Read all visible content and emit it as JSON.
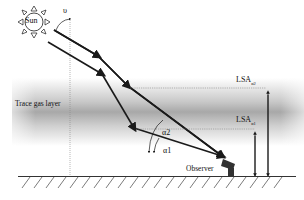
{
  "labels": {
    "sun": "Sun",
    "zenith_angle": "υ",
    "trace_gas_layer": "Trace gas layer",
    "alpha1": "α1",
    "alpha2": "α2",
    "observer": "Observer",
    "lsa1_main": "LSA",
    "lsa1_sub": "α1",
    "lsa2_main": "LSA",
    "lsa2_sub": "α2"
  },
  "colors": {
    "ink": "#1a1a1a",
    "layer_dark": "#9a9a9a",
    "layer_light": "#ffffff",
    "ground": "#333333"
  }
}
